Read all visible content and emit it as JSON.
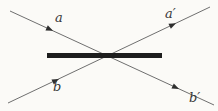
{
  "figure": {
    "background_color": "#fbfaf7",
    "ray_color": "#6f6f6f",
    "arrow_color": "#2e2e2e",
    "barrier_color": "#1d1d1d",
    "label_color": "#383838",
    "labels": {
      "a": "a",
      "a_prime": "a′",
      "b": "b",
      "b_prime": "b′"
    }
  }
}
